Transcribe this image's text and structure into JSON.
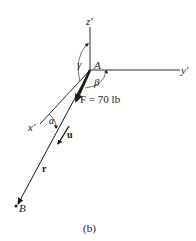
{
  "diagram": {
    "caption": "(b)",
    "origin_label": "A",
    "end_point_label": "B",
    "axes": {
      "x": "x'",
      "y": "y'",
      "z": "z'"
    },
    "force": {
      "label": "F = 70 lb"
    },
    "vectors": {
      "position": "r",
      "unit": "u"
    },
    "angles": {
      "alpha": "α",
      "beta": "β",
      "gamma": "γ"
    },
    "colors": {
      "line": "#1a1a1a",
      "background": "#ffffff"
    }
  }
}
